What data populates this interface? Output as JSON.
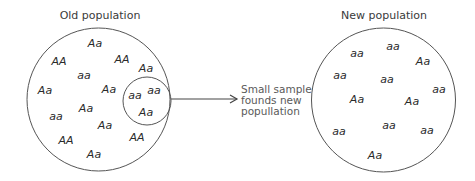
{
  "old_population": {
    "title": "Old population",
    "individuals": [
      {
        "genotype": "Aa"
      },
      {
        "genotype": "AA"
      },
      {
        "genotype": "AA"
      },
      {
        "genotype": "Aa"
      },
      {
        "genotype": "aa"
      },
      {
        "genotype": "Aa"
      },
      {
        "genotype": "Aa"
      },
      {
        "genotype": "Aa"
      },
      {
        "genotype": "aa"
      },
      {
        "genotype": "Aa"
      },
      {
        "genotype": "AA"
      },
      {
        "genotype": "AA"
      },
      {
        "genotype": "Aa"
      }
    ],
    "sample": {
      "individuals": [
        {
          "genotype": "aa"
        },
        {
          "genotype": "aa"
        },
        {
          "genotype": "Aa"
        }
      ]
    }
  },
  "arrow_label": [
    "Small sample",
    "founds new",
    "popullation"
  ],
  "new_population": {
    "title": "New population",
    "individuals": [
      {
        "genotype": "aa"
      },
      {
        "genotype": "aa"
      },
      {
        "genotype": "Aa"
      },
      {
        "genotype": "aa"
      },
      {
        "genotype": "aa"
      },
      {
        "genotype": "aa"
      },
      {
        "genotype": "Aa"
      },
      {
        "genotype": "Aa"
      },
      {
        "genotype": "aa"
      },
      {
        "genotype": "aa"
      },
      {
        "genotype": "aa"
      },
      {
        "genotype": "Aa"
      }
    ]
  }
}
